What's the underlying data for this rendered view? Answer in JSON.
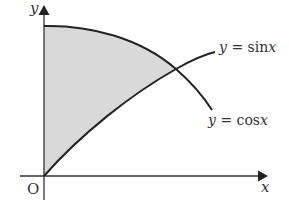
{
  "diagram": {
    "axes": {
      "x_label": "x",
      "y_label": "y",
      "origin_label": "O"
    },
    "curves": [
      {
        "name": "sin",
        "label_lhs": "y",
        "label_eq": "=",
        "label_rhs": "sin",
        "label_var": "x"
      },
      {
        "name": "cos",
        "label_lhs": "y",
        "label_eq": "=",
        "label_rhs": "cos",
        "label_var": "x"
      }
    ],
    "shaded_region": "between y-axis, y = cos x (above) and y = sin x (below), from x = 0 to intersection",
    "colors": {
      "shade": "#d9d9d9",
      "line": "#222222",
      "text": "#333333"
    }
  }
}
